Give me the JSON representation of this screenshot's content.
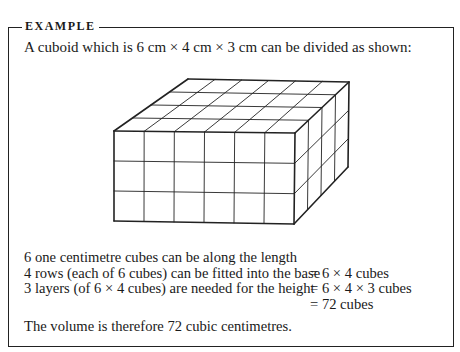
{
  "example": {
    "heading": "EXAMPLE",
    "intro": "A cuboid which is 6 cm × 4 cm × 3 cm can be divided as shown:",
    "diagram": {
      "type": "cuboid-grid",
      "length_cubes": 6,
      "width_cubes": 4,
      "height_cubes": 3
    },
    "working": [
      {
        "lhs": "6 one centimetre cubes can be along the length",
        "rhs": ""
      },
      {
        "lhs": "4 rows (each of 6 cubes) can be fitted into the base",
        "rhs": "= 6 × 4 cubes"
      },
      {
        "lhs": "3 layers (of 6 × 4 cubes) are needed for the height",
        "rhs": "= 6 × 4 × 3 cubes"
      },
      {
        "lhs": "",
        "rhs": "= 72 cubes"
      }
    ],
    "conclusion": "The volume is therefore 72 cubic centimetres."
  }
}
